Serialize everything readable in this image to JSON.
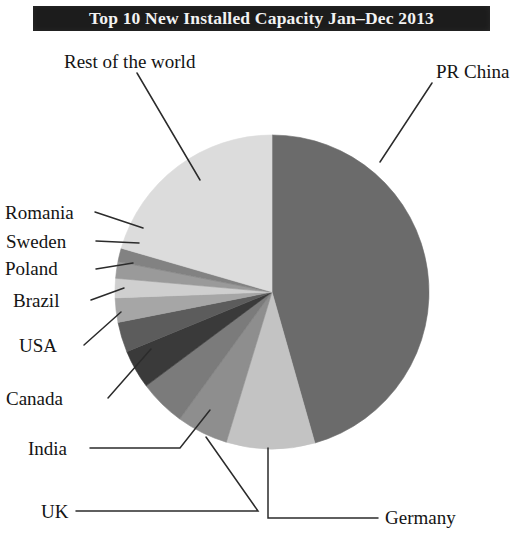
{
  "title": "Top 10 New Installed Capacity Jan–Dec 2013",
  "chart_data": {
    "type": "pie",
    "title": "Top 10 New Installed Capacity Jan–Dec 2013",
    "xlabel": "",
    "ylabel": "",
    "legend_position": "none",
    "labels_position": "outside-with-leader-lines",
    "grid": false,
    "categories": [
      "PR China",
      "Germany",
      "UK",
      "India",
      "Canada",
      "USA",
      "Brazil",
      "Poland",
      "Sweden",
      "Romania",
      "Rest of the world"
    ],
    "values": [
      45.6,
      9.1,
      5.3,
      4.8,
      4.0,
      3.1,
      2.5,
      2.0,
      1.7,
      1.4,
      20.5
    ],
    "units": "percent of total new installed capacity",
    "slice_colors": [
      "#6b6b6b",
      "#c3c3c3",
      "#8e8e8e",
      "#7b7b7b",
      "#3a3a3a",
      "#5c5c5c",
      "#a6a6a6",
      "#cfcfcf",
      "#9a9a9a",
      "#828282",
      "#dcdcdc"
    ]
  },
  "labels": {
    "rest_of_world": "Rest of the world",
    "pr_china": "PR China",
    "romania": "Romania",
    "sweden": "Sweden",
    "poland": "Poland",
    "brazil": "Brazil",
    "usa": "USA",
    "canada": "Canada",
    "india": "India",
    "uk": "UK",
    "germany": "Germany"
  },
  "colors": {
    "title_band_background": "#1c1c1c",
    "title_text": "#f2f2f2",
    "page_background": "#ffffff",
    "leader_line": "#2b2b2b",
    "label_text": "#141414"
  }
}
